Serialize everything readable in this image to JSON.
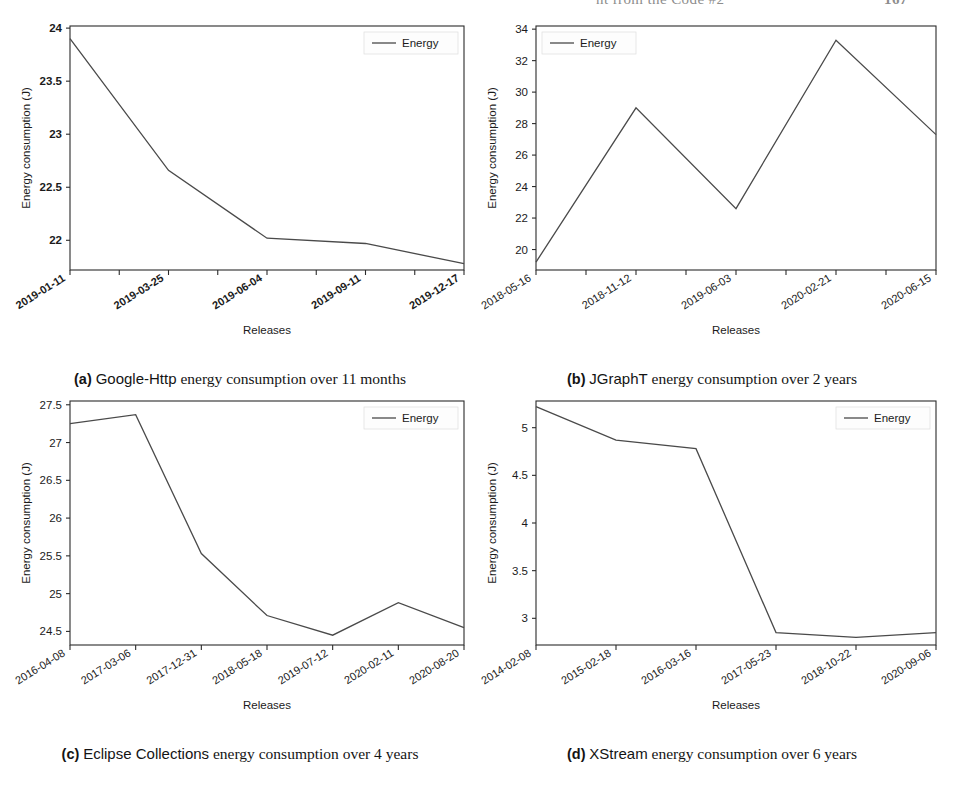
{
  "header": {
    "title": "nt from the Code #2",
    "folio": "167"
  },
  "figure": {
    "axis": {
      "ylabel": "Energy consumption (J)",
      "xlabel": "Releases",
      "legend_label": "Energy"
    },
    "subfigures": [
      {
        "key": "(a)",
        "subject": "Google-Http",
        "rest": "energy consumption over 11 months",
        "caption_full": "(a) Google-Http energy consumption over 11 months"
      },
      {
        "key": "(b)",
        "subject": "JGraphT",
        "rest": "energy consumption over 2 years",
        "caption_full": "(b) JGraphT energy consumption over 2 years"
      },
      {
        "key": "(c)",
        "subject": "Eclipse Collections",
        "rest": "energy consumption over 4 years",
        "caption_full": "(c) Eclipse Collections energy consumption over 4 years"
      },
      {
        "key": "(d)",
        "subject": "XStream",
        "rest": "energy consumption over 6 years",
        "caption_full": "(d) XStream energy consumption over 6 years"
      }
    ]
  },
  "chart_data": [
    {
      "id": "a",
      "type": "line",
      "title": "Google-Http energy consumption over 11 months",
      "xlabel": "Releases",
      "ylabel": "Energy consumption (J)",
      "legend": [
        "Energy"
      ],
      "legend_position": "upper right",
      "grid": false,
      "categories": [
        "2019-01-11",
        "2019-03-25",
        "2019-06-04",
        "2019-09-11",
        "2019-12-17"
      ],
      "x_tick_labels": [
        "2019-01-11",
        "2019-03-25",
        "2019-06-04",
        "2019-09-11",
        "2019-12-17"
      ],
      "x_minor_ticks": 9,
      "values": [
        23.9,
        22.66,
        22.02,
        21.97,
        21.78
      ],
      "y_ticks": [
        22.0,
        22.5,
        23.0,
        23.5,
        24.0
      ],
      "ylim": [
        21.72,
        24.02
      ],
      "series": [
        {
          "name": "Energy",
          "values": [
            23.9,
            22.66,
            22.02,
            21.97,
            21.78
          ]
        }
      ]
    },
    {
      "id": "b",
      "type": "line",
      "title": "JGraphT energy consumption over 2 years",
      "xlabel": "Releases",
      "ylabel": "Energy consumption (J)",
      "legend": [
        "Energy"
      ],
      "legend_position": "upper left",
      "grid": false,
      "categories": [
        "2018-05-16",
        "2018-11-12",
        "2019-06-03",
        "2020-02-21",
        "2020-06-15"
      ],
      "x_tick_labels": [
        "2018-05-16",
        "2018-11-12",
        "2019-06-03",
        "2020-02-21",
        "2020-06-15"
      ],
      "x_minor_ticks": 9,
      "values": [
        19.2,
        29.0,
        22.6,
        33.3,
        27.3
      ],
      "y_ticks": [
        20,
        22,
        24,
        26,
        28,
        30,
        32,
        34
      ],
      "ylim": [
        18.7,
        34.2
      ],
      "series": [
        {
          "name": "Energy",
          "values": [
            19.2,
            29.0,
            22.6,
            33.3,
            27.3
          ]
        }
      ]
    },
    {
      "id": "c",
      "type": "line",
      "title": "Eclipse Collections energy consumption over 4 years",
      "xlabel": "Releases",
      "ylabel": "Energy consumption (J)",
      "legend": [
        "Energy"
      ],
      "legend_position": "upper right",
      "grid": false,
      "categories": [
        "2016-04-08",
        "2017-03-06",
        "2017-12-31",
        "2018-05-18",
        "2019-07-12",
        "2020-02-11",
        "2020-08-20"
      ],
      "x_tick_labels": [
        "2016-04-08",
        "2017-03-06",
        "2017-12-31",
        "2018-05-18",
        "2019-07-12",
        "2020-02-11",
        "2020-08-20"
      ],
      "x_minor_ticks": 7,
      "values": [
        27.25,
        27.37,
        25.53,
        24.71,
        24.45,
        24.88,
        24.55
      ],
      "y_ticks": [
        24.5,
        25.0,
        25.5,
        26.0,
        26.5,
        27.0,
        27.5
      ],
      "ylim": [
        24.32,
        27.55
      ],
      "series": [
        {
          "name": "Energy",
          "values": [
            27.25,
            27.37,
            25.53,
            24.71,
            24.45,
            24.88,
            24.55
          ]
        }
      ]
    },
    {
      "id": "d",
      "type": "line",
      "title": "XStream energy consumption over 6 years",
      "xlabel": "Releases",
      "ylabel": "Energy consumption (J)",
      "legend": [
        "Energy"
      ],
      "legend_position": "upper right",
      "grid": false,
      "categories": [
        "2014-02-08",
        "2015-02-18",
        "2016-03-16",
        "2017-05-23",
        "2018-10-22",
        "2020-09-06"
      ],
      "x_tick_labels": [
        "2014-02-08",
        "2015-02-18",
        "2016-03-16",
        "2017-05-23",
        "2018-10-22",
        "2020-09-06"
      ],
      "x_minor_ticks": 6,
      "values": [
        5.22,
        4.87,
        4.78,
        2.85,
        2.8,
        2.85
      ],
      "y_ticks": [
        3.0,
        3.5,
        4.0,
        4.5,
        5.0
      ],
      "ylim": [
        2.72,
        5.28
      ],
      "series": [
        {
          "name": "Energy",
          "values": [
            5.22,
            4.87,
            4.78,
            2.85,
            2.8,
            2.85
          ]
        }
      ]
    }
  ]
}
